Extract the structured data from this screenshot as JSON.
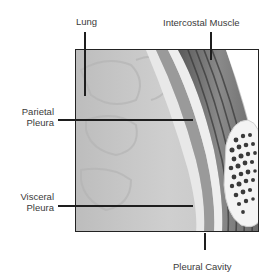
{
  "diagram": {
    "labels": {
      "lung": "Lung",
      "intercostal_muscle": "Intercostal Muscle",
      "parietal_pleura_1": "Parietal",
      "parietal_pleura_2": "Pleura",
      "visceral_pleura_1": "Visceral",
      "visceral_pleura_2": "Pleura",
      "pleural_cavity": "Pleural Cavity"
    },
    "colors": {
      "lung_tissue": "#c9c9c9",
      "pleura_light": "#e6e6e6",
      "muscle_dark": "#4a4a4a",
      "rib_bone": "#f2f2f2",
      "leader_line": "#1e1e1e"
    }
  }
}
